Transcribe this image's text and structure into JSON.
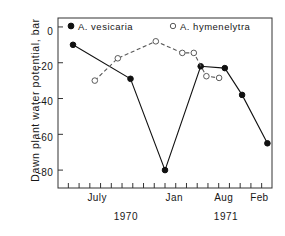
{
  "chart_data": {
    "type": "line",
    "title": "",
    "xlabel": "",
    "ylabel": "Dawn plant water potential, bar",
    "ylim": [
      -90,
      5
    ],
    "xlim": [
      5.3,
      14.6
    ],
    "grid": false,
    "legend_position": "top-inside",
    "y_ticks": [
      0,
      -20,
      -40,
      -60,
      -80
    ],
    "y_tick_labels": [
      "0",
      "-20",
      "-40",
      "-60",
      "-80"
    ],
    "x_tick_count": 19,
    "x_tick_labels": [
      {
        "label": "July",
        "x": 7
      },
      {
        "label": "Jan",
        "x": 10.35
      },
      {
        "label": "Aug",
        "x": 12.5
      },
      {
        "label": "Feb",
        "x": 14.05
      }
    ],
    "group_labels": [
      {
        "label": "1970",
        "x": 8.25
      },
      {
        "label": "1971",
        "x": 12.6
      }
    ],
    "series": [
      {
        "name": "A. vesicaria",
        "marker": "filled-circle",
        "line_style": "solid",
        "color": "#111111",
        "points": [
          {
            "x": 5.95,
            "y": -10
          },
          {
            "x": 8.45,
            "y": -29
          },
          {
            "x": 9.95,
            "y": -80
          },
          {
            "x": 11.5,
            "y": -22
          },
          {
            "x": 12.55,
            "y": -23
          },
          {
            "x": 13.3,
            "y": -38
          },
          {
            "x": 14.4,
            "y": -65
          }
        ]
      },
      {
        "name": "A. hymenelytra",
        "marker": "open-circle",
        "line_style": "dashed",
        "color": "#5a5a5a",
        "points": [
          {
            "x": 6.9,
            "y": -30
          },
          {
            "x": 7.9,
            "y": -17.5
          },
          {
            "x": 9.55,
            "y": -8
          },
          {
            "x": 10.7,
            "y": -14.5
          },
          {
            "x": 11.2,
            "y": -14.5
          },
          {
            "x": 11.75,
            "y": -27.5
          },
          {
            "x": 12.3,
            "y": -28.5
          }
        ]
      }
    ]
  },
  "legend": {
    "vesicaria": "A. vesicaria",
    "hymenelytra": "A. hymenelytra"
  },
  "axis": {
    "y_title": "Dawn plant water potential, bar",
    "y_tick_0": "0",
    "y_tick_1": "-20",
    "y_tick_2": "-40",
    "y_tick_3": "-60",
    "y_tick_4": "-80",
    "x_tick_0": "July",
    "x_tick_1": "Jan",
    "x_tick_2": "Aug",
    "x_tick_3": "Feb",
    "year_0": "1970",
    "year_1": "1971"
  }
}
